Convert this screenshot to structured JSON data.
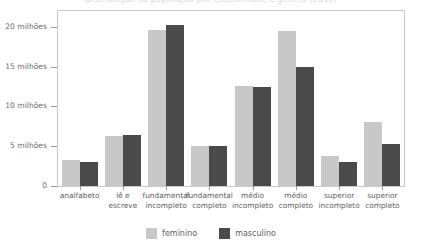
{
  "chart_data": {
    "type": "bar",
    "title": "Distribuição da população por escolaridade e gênero (2010)",
    "xlabel": "",
    "ylabel": "",
    "ylim": [
      0,
      22
    ],
    "grid": false,
    "legend_position": "bottom-center",
    "categories": [
      "analfabeto",
      "lê e\nescreve",
      "fundamental\nincompleto",
      "fundamental\ncompleto",
      "médio\nincompleto",
      "médio\ncompleto",
      "superior\nincompleto",
      "superior\ncompleto"
    ],
    "ytick_values": [
      0,
      5,
      10,
      15,
      20
    ],
    "ytick_labels": [
      "0",
      "5 milhões",
      "10 milhões",
      "15 milhões",
      "20 milhões"
    ],
    "series": [
      {
        "name": "feminino",
        "color": "#c8c8c8",
        "values": [
          3.3,
          6.3,
          19.6,
          5.0,
          12.6,
          19.5,
          3.8,
          8.1
        ]
      },
      {
        "name": "masculino",
        "color": "#4a4a4a",
        "values": [
          3.0,
          6.4,
          20.2,
          5.0,
          12.5,
          15.0,
          3.0,
          5.3
        ]
      }
    ]
  },
  "colors": {
    "feminino": "#c8c8c8",
    "masculino": "#4a4a4a",
    "axis": "#9a9a9a",
    "frame": "#c9c9c9",
    "tick_text": "#5e5e5e"
  }
}
